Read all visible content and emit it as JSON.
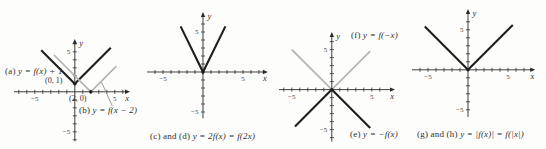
{
  "figure": {
    "background": "#fdfdfc",
    "colors": {
      "dark_line": "#1f1f1f",
      "gray_line": "#b3b3b3",
      "axis": "#2a2a2a",
      "leader": "#8f8f8f",
      "text": "#2e2e2e"
    }
  },
  "chart_data": [
    {
      "type": "line",
      "name": "shift-transformations",
      "xlabel": "x",
      "ylabel": "y",
      "x_range": [
        -7.6,
        6.9
      ],
      "y_range": [
        -6.2,
        6.6
      ],
      "x_ticks": [
        -7,
        6
      ],
      "y_ticks": [
        -6,
        6
      ],
      "tick_labels": [
        {
          "axis": "x",
          "value": -5,
          "text": "−5"
        },
        {
          "axis": "x",
          "value": 5,
          "text": "5"
        },
        {
          "axis": "y",
          "value": 5,
          "text": "5"
        },
        {
          "axis": "y",
          "value": -5,
          "text": "−5"
        }
      ],
      "center_px": [
        75,
        92
      ],
      "series": [
        {
          "key": "a",
          "name": "y = f(x) + 1",
          "color_key": "dark",
          "points": [
            [
              -4.2,
              5.2
            ],
            [
              0,
              1
            ],
            [
              4.5,
              5.5
            ]
          ]
        },
        {
          "key": "b",
          "name": "y = f(x − 2)",
          "color_key": "gray",
          "points": [
            [
              -2.6,
              4.6
            ],
            [
              2,
              0
            ],
            [
              5.2,
              3.2
            ]
          ]
        }
      ],
      "markers": [
        {
          "x": 0,
          "y": 1
        },
        {
          "x": 2,
          "y": 0
        }
      ],
      "leaders": [
        [
          3.3,
          1.3,
          4.7,
          -1.8
        ]
      ],
      "annotations": [
        {
          "key": "label-a",
          "kind": "label",
          "prefix": "(a) ",
          "formula": "y = f(x) + 1",
          "left": 5,
          "top": 66
        },
        {
          "key": "label-point-0-1",
          "kind": "coord",
          "prefix": "(0, 1)",
          "formula": "",
          "left": 45,
          "top": 76
        },
        {
          "key": "label-point-2-0",
          "kind": "coord",
          "prefix": "(2, 0)",
          "formula": "",
          "left": 69,
          "top": 94
        },
        {
          "key": "label-b",
          "kind": "label",
          "prefix": "(b) ",
          "formula": "y = f(x − 2)",
          "left": 79,
          "top": 105
        }
      ]
    },
    {
      "type": "line",
      "name": "stretch-transformations",
      "xlabel": "x",
      "ylabel": "y",
      "x_range": [
        -7.0,
        8.1
      ],
      "y_range": [
        -5.8,
        7.5
      ],
      "x_ticks": [
        -6,
        7
      ],
      "y_ticks": [
        -5,
        6
      ],
      "tick_labels": [
        {
          "axis": "x",
          "value": -5,
          "text": "−5"
        },
        {
          "axis": "x",
          "value": 5,
          "text": "5"
        },
        {
          "axis": "y",
          "value": 5,
          "text": "5"
        },
        {
          "axis": "y",
          "value": -5,
          "text": "−5"
        }
      ],
      "center_px": [
        203,
        72
      ],
      "series": [
        {
          "key": "cd",
          "name": "y = 2f(x) = f(2x)",
          "color_key": "dark",
          "points": [
            [
              -2.8,
              5.7
            ],
            [
              0,
              0
            ],
            [
              2.8,
              5.7
            ]
          ]
        }
      ],
      "markers": [
        {
          "x": 0,
          "y": 0
        }
      ],
      "leaders": [],
      "annotations": [
        {
          "key": "caption-cd",
          "kind": "label",
          "prefix": "(c) and (d) ",
          "formula": "y = 2f(x) = f(2x)",
          "left": 150,
          "top": 131
        }
      ]
    },
    {
      "type": "line",
      "name": "reflect-transformations",
      "xlabel": "x",
      "ylabel": "y",
      "x_range": [
        -6.6,
        7.9
      ],
      "y_range": [
        -6.5,
        7.2
      ],
      "x_ticks": [
        -6,
        6
      ],
      "y_ticks": [
        -6,
        6
      ],
      "tick_labels": [
        {
          "axis": "x",
          "value": -5,
          "text": "−5"
        },
        {
          "axis": "x",
          "value": 5,
          "text": "5"
        },
        {
          "axis": "y",
          "value": 5,
          "text": "5"
        },
        {
          "axis": "y",
          "value": -5,
          "text": "−5"
        }
      ],
      "center_px": [
        332,
        90
      ],
      "series": [
        {
          "key": "f",
          "name": "y = f(−x)",
          "color_key": "gray",
          "points": [
            [
              -5.0,
              5.0
            ],
            [
              0,
              0
            ],
            [
              4.8,
              4.8
            ]
          ]
        },
        {
          "key": "e",
          "name": "y = −f(x)",
          "color_key": "dark",
          "points": [
            [
              -4.6,
              -4.6
            ],
            [
              0,
              0
            ],
            [
              4.8,
              -4.8
            ]
          ]
        }
      ],
      "markers": [
        {
          "x": 0,
          "y": 0
        }
      ],
      "leaders": [],
      "annotations": [
        {
          "key": "label-f",
          "kind": "label",
          "prefix": "(f) ",
          "formula": "y = f(−x)",
          "left": 351,
          "top": 30
        },
        {
          "key": "label-e",
          "kind": "label",
          "prefix": "(e) ",
          "formula": "y = −f(x)",
          "left": 350,
          "top": 129
        }
      ]
    },
    {
      "type": "line",
      "name": "absolute-value-transformations",
      "xlabel": "x",
      "ylabel": "y",
      "x_range": [
        -7.0,
        8.4
      ],
      "y_range": [
        -5.9,
        7.6
      ],
      "x_ticks": [
        -6,
        7
      ],
      "y_ticks": [
        -5,
        6
      ],
      "tick_labels": [
        {
          "axis": "x",
          "value": -5,
          "text": "−5"
        },
        {
          "axis": "x",
          "value": 5,
          "text": "5"
        },
        {
          "axis": "y",
          "value": 5,
          "text": "5"
        },
        {
          "axis": "y",
          "value": -5,
          "text": "−5"
        }
      ],
      "center_px": [
        468,
        70
      ],
      "series": [
        {
          "key": "gh",
          "name": "y = |f(x)| = f(|x|)",
          "color_key": "dark",
          "points": [
            [
              -5.4,
              5.4
            ],
            [
              0,
              0
            ],
            [
              5.6,
              5.6
            ]
          ]
        }
      ],
      "markers": [
        {
          "x": 0,
          "y": 0
        }
      ],
      "leaders": [],
      "annotations": [
        {
          "key": "caption-gh",
          "kind": "label",
          "prefix": "(g) and (h) ",
          "formula": "y = |f(x)| = f(|x|)",
          "left": 417,
          "top": 129
        }
      ]
    }
  ]
}
